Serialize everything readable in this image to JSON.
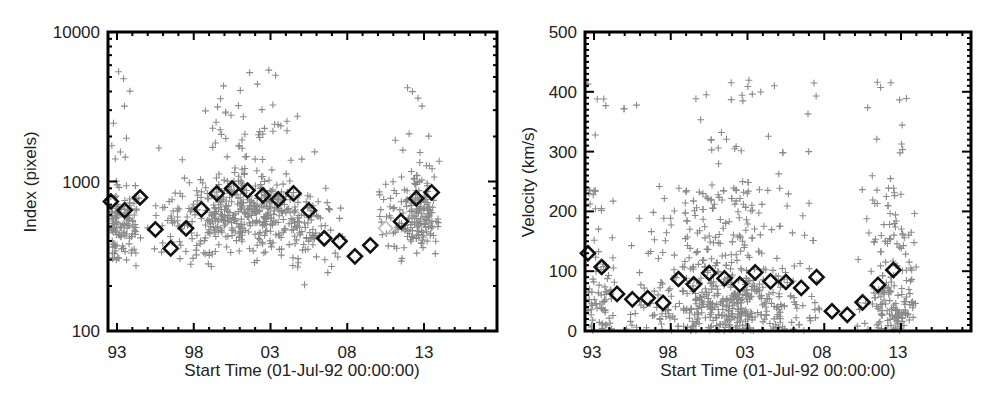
{
  "chart_data": [
    {
      "type": "scatter",
      "title": "",
      "xlabel": "Start Time (01-Jul-92 00:00:00)",
      "ylabel": "Index (pixels)",
      "yscale": "log",
      "ylim": [
        100,
        10000
      ],
      "xlim": [
        1992.6,
        2018.0
      ],
      "xticks": [
        {
          "label": "93",
          "value": 1993.0
        },
        {
          "label": "98",
          "value": 1998.0
        },
        {
          "label": "03",
          "value": 2003.0
        },
        {
          "label": "08",
          "value": 2008.0
        },
        {
          "label": "13",
          "value": 2013.0
        }
      ],
      "yticks": [
        {
          "label": "100",
          "value": 100
        },
        {
          "label": "1000",
          "value": 1000
        },
        {
          "label": "10000",
          "value": 10000
        }
      ],
      "grid": false,
      "legend": null,
      "series": [
        {
          "name": "individual events",
          "marker": "plus",
          "color": "#8a8a8a",
          "description": "dense cloud of events, floor ~200 px, mostly 200-2000 px, outliers up to ~5500 px; data gap 2007.5-2010.0",
          "count_estimate": 900
        },
        {
          "name": "yearly mean",
          "marker": "diamond",
          "color": "#111111",
          "x": [
            1992.6,
            1993.5,
            1994.5,
            1995.5,
            1996.5,
            1997.5,
            1998.5,
            1999.5,
            2000.5,
            2001.5,
            2002.5,
            2003.5,
            2004.5,
            2005.5,
            2006.5,
            2007.5,
            2008.5,
            2009.5,
            2010.5,
            2011.5,
            2012.5,
            2013.5
          ],
          "values": [
            735,
            641,
            782,
            478,
            357,
            486,
            651,
            832,
            898,
            871,
            807,
            759,
            832,
            641,
            417,
            398,
            316,
            374,
            486,
            541,
            771,
            845
          ],
          "hollow_indices": [
            18
          ]
        }
      ]
    },
    {
      "type": "scatter",
      "title": "",
      "xlabel": "Start Time (01-Jul-92 00:00:00)",
      "ylabel": "Velocity (km/s)",
      "yscale": "linear",
      "ylim": [
        0,
        500
      ],
      "xlim": [
        1992.6,
        2018.0
      ],
      "xticks": [
        {
          "label": "93",
          "value": 1993.0
        },
        {
          "label": "98",
          "value": 1998.0
        },
        {
          "label": "03",
          "value": 2003.0
        },
        {
          "label": "08",
          "value": 2008.0
        },
        {
          "label": "13",
          "value": 2013.0
        }
      ],
      "yticks": [
        {
          "label": "0",
          "value": 0
        },
        {
          "label": "100",
          "value": 100
        },
        {
          "label": "200",
          "value": 200
        },
        {
          "label": "300",
          "value": 300
        },
        {
          "label": "400",
          "value": 400
        },
        {
          "label": "500",
          "value": 500
        }
      ],
      "grid": false,
      "legend": null,
      "series": [
        {
          "name": "individual events",
          "marker": "plus",
          "color": "#8a8a8a",
          "description": "dense cloud of events, mostly 0-150 km/s, outliers up to ~420 km/s; data gap 2007.5-2010.0",
          "count_estimate": 900
        },
        {
          "name": "yearly mean",
          "marker": "diamond",
          "color": "#111111",
          "x": [
            1992.6,
            1993.5,
            1994.5,
            1995.5,
            1996.5,
            1997.5,
            1998.5,
            1999.5,
            2000.5,
            2001.5,
            2002.5,
            2003.5,
            2004.5,
            2005.5,
            2006.5,
            2007.5,
            2008.5,
            2009.5,
            2010.5,
            2011.5,
            2012.5
          ],
          "values": [
            130,
            107,
            62,
            53,
            55,
            47,
            87,
            78,
            97,
            88,
            78,
            98,
            83,
            82,
            72,
            90,
            33,
            27,
            48,
            77,
            102
          ],
          "hollow_indices": []
        }
      ]
    }
  ],
  "plots": {
    "left": {
      "ylabel": "Index (pixels)",
      "xlabel": "Start Time (01-Jul-92 00:00:00)",
      "yticks": [
        "100",
        "1000",
        "10000"
      ],
      "xticks": [
        "93",
        "98",
        "03",
        "08",
        "13"
      ]
    },
    "right": {
      "ylabel": "Velocity (km/s)",
      "xlabel": "Start Time (01-Jul-92 00:00:00)",
      "yticks": [
        "0",
        "100",
        "200",
        "300",
        "400",
        "500"
      ],
      "xticks": [
        "93",
        "98",
        "03",
        "08",
        "13"
      ]
    }
  }
}
